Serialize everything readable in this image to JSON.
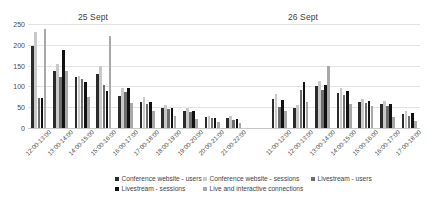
{
  "chart_data": {
    "type": "bar",
    "title": "",
    "xlabel": "",
    "ylabel": "",
    "ylim": [
      0,
      250
    ],
    "yticks": [
      0,
      50,
      100,
      150,
      200,
      250
    ],
    "grid": true,
    "legend_position": "bottom",
    "series_names": [
      "Conference website - users",
      "Conference website - sessions",
      "Livestream - users",
      "Livestream - sessions",
      "Live and interactive connections"
    ],
    "series_colors": [
      "#2b2b2b",
      "#c9c9c9",
      "#6e6e6e",
      "#111111",
      "#a8a8a8"
    ],
    "panels": [
      {
        "name": "25 Sept",
        "categories": [
          "12:00-13:00",
          "13:00-14:00",
          "14:00-15:00",
          "15:00-16:00",
          "16:00-17:00",
          "17:00-18:00",
          "18:00-19:00",
          "19:00-20:00",
          "20:00-21:00",
          "21:00-22:00"
        ],
        "series": [
          {
            "name": "Conference website - users",
            "values": [
              196,
              138,
              123,
              131,
              78,
              62,
              48,
              42,
              26,
              24
            ]
          },
          {
            "name": "Conference website - sessions",
            "values": [
              232,
              155,
              125,
              150,
              95,
              74,
              56,
              48,
              30,
              28
            ]
          },
          {
            "name": "Livestream - users",
            "values": [
              72,
              122,
              118,
              104,
              86,
              58,
              45,
              38,
              24,
              20
            ]
          },
          {
            "name": "Livestream - sessions",
            "values": [
              72,
              188,
              110,
              88,
              95,
              62,
              48,
              42,
              25,
              22
            ]
          },
          {
            "name": "Live and interactive connections",
            "values": [
              237,
              137,
              74,
              220,
              60,
              40,
              28,
              22,
              14,
              12
            ]
          }
        ]
      },
      {
        "name": "26 Sept",
        "categories": [
          "11:00-12:00",
          "12:00-13:00",
          "13:00-14:00",
          "14:00-15:00",
          "15:00-16:00",
          "16:00-17:00",
          "17:00-18:00"
        ],
        "series": [
          {
            "name": "Conference website - users",
            "values": [
              70,
              48,
              100,
              84,
              62,
              58,
              34
            ]
          },
          {
            "name": "Conference website - sessions",
            "values": [
              82,
              55,
              112,
              95,
              70,
              64,
              40
            ]
          },
          {
            "name": "Livestream - users",
            "values": [
              50,
              92,
              92,
              80,
              60,
              54,
              30
            ]
          },
          {
            "name": "Livestream - sessions",
            "values": [
              68,
              110,
              104,
              88,
              66,
              58,
              36
            ]
          },
          {
            "name": "Live and interactive connections",
            "values": [
              40,
              62,
              148,
              58,
              54,
              26,
              18
            ]
          }
        ]
      }
    ]
  }
}
